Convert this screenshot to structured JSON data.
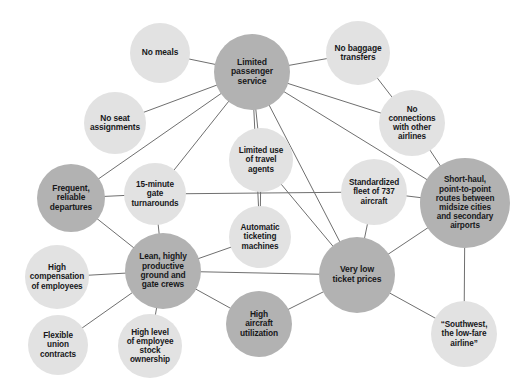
{
  "diagram": {
    "type": "node-link-network",
    "canvas": {
      "width": 514,
      "height": 388
    },
    "palette": {
      "core_node_fill": "#b2b2b2",
      "support_node_fill": "#e2e2e2",
      "edge_stroke": "#6f6f6f",
      "label_text": "#17181a",
      "background": "#ffffff"
    },
    "nodes": [
      {
        "id": "limited-passenger-service",
        "label": "Limited\npassenger\nservice",
        "tone": "dark",
        "cx": 252,
        "cy": 72,
        "r": 38,
        "font": 8.6
      },
      {
        "id": "no-meals",
        "label": "No meals",
        "tone": "light",
        "cx": 160,
        "cy": 53,
        "r": 30,
        "font": 8.4
      },
      {
        "id": "no-seat-assignments",
        "label": "No seat\nassignments",
        "tone": "light",
        "cx": 115,
        "cy": 123,
        "r": 31,
        "font": 8.4
      },
      {
        "id": "no-baggage-transfers",
        "label": "No baggage\ntransfers",
        "tone": "light",
        "cx": 358,
        "cy": 53,
        "r": 32,
        "font": 8.4
      },
      {
        "id": "no-connections",
        "label": "No\nconnections\nwith other\nairlines",
        "tone": "light",
        "cx": 412,
        "cy": 123,
        "r": 33,
        "font": 8.2
      },
      {
        "id": "limited-use-travel-agents",
        "label": "Limited use\nof travel\nagents",
        "tone": "light",
        "cx": 261,
        "cy": 160,
        "r": 32,
        "font": 8.2
      },
      {
        "id": "fifteen-minute-turnarounds",
        "label": "15-minute\ngate\nturnarounds",
        "tone": "light",
        "cx": 155,
        "cy": 194,
        "r": 31,
        "font": 8.2
      },
      {
        "id": "frequent-reliable-departures",
        "label": "Frequent,\nreliable\ndepartures",
        "tone": "dark",
        "cx": 71,
        "cy": 198,
        "r": 34,
        "font": 8.4
      },
      {
        "id": "standardized-fleet-737",
        "label": "Standardized\nfleet of 737\naircraft",
        "tone": "light",
        "cx": 374,
        "cy": 192,
        "r": 33,
        "font": 8.2
      },
      {
        "id": "short-haul-point-to-point",
        "label": "Short-haul,\npoint-to-point\nroutes between\nmidsize cities\nand secondary\nairports",
        "tone": "dark",
        "cx": 465,
        "cy": 203,
        "r": 45,
        "font": 8.2
      },
      {
        "id": "automatic-ticketing",
        "label": "Automatic\nticketing\nmachines",
        "tone": "light",
        "cx": 260,
        "cy": 237,
        "r": 31,
        "font": 8.2
      },
      {
        "id": "lean-productive-crews",
        "label": "Lean, highly\nproductive\nground and\ngate crews",
        "tone": "dark",
        "cx": 163,
        "cy": 271,
        "r": 38,
        "font": 8.4
      },
      {
        "id": "very-low-ticket-prices",
        "label": "Very low\nticket prices",
        "tone": "dark",
        "cx": 357,
        "cy": 275,
        "r": 38,
        "font": 8.6
      },
      {
        "id": "high-compensation",
        "label": "High\ncompensation\nof employees",
        "tone": "light",
        "cx": 57,
        "cy": 277,
        "r": 32,
        "font": 8.2
      },
      {
        "id": "high-aircraft-utilization",
        "label": "High\naircraft\nutilization",
        "tone": "dark",
        "cx": 259,
        "cy": 324,
        "r": 33,
        "font": 8.4
      },
      {
        "id": "flexible-union-contracts",
        "label": "Flexible\nunion\ncontracts",
        "tone": "light",
        "cx": 58,
        "cy": 345,
        "r": 30,
        "font": 8.2
      },
      {
        "id": "high-level-stock-ownership",
        "label": "High level\nof employee\nstock\nownership",
        "tone": "light",
        "cx": 150,
        "cy": 346,
        "r": 32,
        "font": 8.2
      },
      {
        "id": "southwest-low-fare-airline",
        "label": "“Southwest,\nthe low-fare\nairline”",
        "tone": "light",
        "cx": 464,
        "cy": 334,
        "r": 33,
        "font": 8.2
      }
    ],
    "edges": [
      {
        "from": "limited-passenger-service",
        "to": "no-meals"
      },
      {
        "from": "limited-passenger-service",
        "to": "no-seat-assignments"
      },
      {
        "from": "limited-passenger-service",
        "to": "no-baggage-transfers"
      },
      {
        "from": "limited-passenger-service",
        "to": "no-connections"
      },
      {
        "from": "limited-passenger-service",
        "to": "limited-use-travel-agents"
      },
      {
        "from": "limited-passenger-service",
        "to": "frequent-reliable-departures"
      },
      {
        "from": "limited-passenger-service",
        "to": "fifteen-minute-turnarounds"
      },
      {
        "from": "limited-passenger-service",
        "to": "automatic-ticketing"
      },
      {
        "from": "limited-passenger-service",
        "to": "very-low-ticket-prices"
      },
      {
        "from": "limited-passenger-service",
        "to": "short-haul-point-to-point"
      },
      {
        "from": "no-baggage-transfers",
        "to": "no-connections"
      },
      {
        "from": "no-connections",
        "to": "short-haul-point-to-point"
      },
      {
        "from": "fifteen-minute-turnarounds",
        "to": "frequent-reliable-departures"
      },
      {
        "from": "fifteen-minute-turnarounds",
        "to": "lean-productive-crews"
      },
      {
        "from": "fifteen-minute-turnarounds",
        "to": "standardized-fleet-737"
      },
      {
        "from": "limited-use-travel-agents",
        "to": "very-low-ticket-prices"
      },
      {
        "from": "limited-use-travel-agents",
        "to": "automatic-ticketing"
      },
      {
        "from": "frequent-reliable-departures",
        "to": "lean-productive-crews"
      },
      {
        "from": "standardized-fleet-737",
        "to": "very-low-ticket-prices"
      },
      {
        "from": "standardized-fleet-737",
        "to": "short-haul-point-to-point"
      },
      {
        "from": "short-haul-point-to-point",
        "to": "very-low-ticket-prices"
      },
      {
        "from": "short-haul-point-to-point",
        "to": "southwest-low-fare-airline"
      },
      {
        "from": "lean-productive-crews",
        "to": "automatic-ticketing"
      },
      {
        "from": "lean-productive-crews",
        "to": "high-compensation"
      },
      {
        "from": "lean-productive-crews",
        "to": "flexible-union-contracts"
      },
      {
        "from": "lean-productive-crews",
        "to": "high-level-stock-ownership"
      },
      {
        "from": "lean-productive-crews",
        "to": "high-aircraft-utilization"
      },
      {
        "from": "lean-productive-crews",
        "to": "very-low-ticket-prices"
      },
      {
        "from": "high-aircraft-utilization",
        "to": "very-low-ticket-prices"
      },
      {
        "from": "very-low-ticket-prices",
        "to": "southwest-low-fare-airline"
      }
    ]
  }
}
